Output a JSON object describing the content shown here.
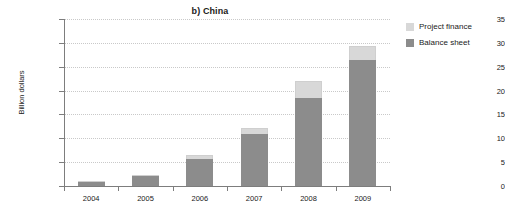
{
  "chart_data": {
    "type": "bar",
    "stacked": true,
    "title": "b) China",
    "xlabel": "",
    "ylabel": "Billion dollars",
    "categories": [
      "2004",
      "2005",
      "2006",
      "2007",
      "2008",
      "2009"
    ],
    "series": [
      {
        "name": "Balance sheet",
        "color": "#8c8c8c",
        "values": [
          0.9,
          2.0,
          5.6,
          11.0,
          18.4,
          26.4
        ]
      },
      {
        "name": "Project finance",
        "color": "#d8d8d8",
        "values": [
          0.1,
          0.2,
          0.8,
          1.2,
          3.6,
          3.0
        ]
      }
    ],
    "totals": [
      1.0,
      2.2,
      6.4,
      12.2,
      22.0,
      29.4
    ],
    "ylim": [
      0,
      35
    ],
    "yticks": [
      0,
      5,
      10,
      15,
      20,
      25,
      30,
      35
    ],
    "ytick_labels": [
      "0",
      "5",
      "10",
      "15",
      "20",
      "25",
      "30",
      "35"
    ],
    "grid": true,
    "grid_axis": "y",
    "legend_position": "right-top",
    "legend_entries": [
      "Project finance",
      "Balance sheet"
    ]
  },
  "legend": {
    "items": [
      {
        "label": "Project finance",
        "color": "#d8d8d8"
      },
      {
        "label": "Balance sheet",
        "color": "#8c8c8c"
      }
    ]
  }
}
